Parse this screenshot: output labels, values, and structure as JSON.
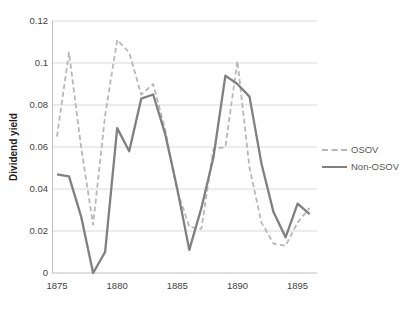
{
  "chart_data": {
    "type": "line",
    "title": "",
    "xlabel": "",
    "ylabel": "Dividend yield",
    "grid": true,
    "legend_position": "right",
    "ylim": [
      0,
      0.12
    ],
    "y_ticks": [
      0,
      0.02,
      0.04,
      0.06,
      0.08,
      0.1,
      0.12
    ],
    "y_tick_labels": [
      "0",
      "0.02",
      "0.04",
      "0.06",
      "0.08",
      "0.1",
      "0.12"
    ],
    "x_tick_years": [
      1875,
      1880,
      1885,
      1890,
      1895
    ],
    "x_tick_labels": [
      "1875",
      "1880",
      "1885",
      "1890",
      "1895"
    ],
    "x": [
      1875,
      1876,
      1877,
      1878,
      1879,
      1880,
      1881,
      1882,
      1883,
      1884,
      1885,
      1886,
      1887,
      1888,
      1889,
      1890,
      1891,
      1892,
      1893,
      1894,
      1895,
      1896
    ],
    "series": [
      {
        "name": "OSOV",
        "style": "dashed",
        "color": "#b7b7b7",
        "values": [
          0.065,
          0.105,
          0.06,
          0.023,
          0.075,
          0.111,
          0.105,
          0.085,
          0.09,
          0.068,
          0.039,
          0.022,
          0.021,
          0.059,
          0.06,
          0.101,
          0.05,
          0.024,
          0.014,
          0.013,
          0.024,
          0.031
        ]
      },
      {
        "name": "Non-OSOV",
        "style": "solid",
        "color": "#808080",
        "values": [
          0.047,
          0.046,
          0.027,
          0.0,
          0.01,
          0.069,
          0.058,
          0.083,
          0.085,
          0.066,
          0.04,
          0.011,
          0.031,
          0.055,
          0.094,
          0.09,
          0.084,
          0.052,
          0.029,
          0.017,
          0.033,
          0.028
        ]
      }
    ]
  }
}
